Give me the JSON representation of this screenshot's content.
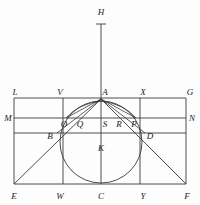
{
  "figure": {
    "type": "euclidean-construction",
    "canvas": {
      "width": 200,
      "height": 205
    },
    "stroke_color": "#3a3a3a",
    "label_color": "#1a1a1a",
    "background_color": "#fdfdfd"
  },
  "labels": {
    "H": "H",
    "L": "L",
    "V": "V",
    "A": "A",
    "X": "X",
    "G": "G",
    "M": "M",
    "N": "N",
    "O": "O",
    "Q": "Q",
    "S": "S",
    "R": "R",
    "P": "P",
    "B": "B",
    "D": "D",
    "K": "K",
    "E": "E",
    "W": "W",
    "C": "C",
    "Y": "Y",
    "F": "F"
  },
  "points": {
    "H": {
      "x": 101,
      "y": 12
    },
    "L": {
      "x": 15,
      "y": 92
    },
    "V": {
      "x": 60,
      "y": 92
    },
    "A": {
      "x": 105,
      "y": 92
    },
    "X": {
      "x": 143,
      "y": 92
    },
    "G": {
      "x": 190,
      "y": 92
    },
    "M": {
      "x": 8,
      "y": 118
    },
    "N": {
      "x": 192,
      "y": 118
    },
    "O": {
      "x": 64,
      "y": 124
    },
    "Q": {
      "x": 80,
      "y": 124
    },
    "S": {
      "x": 105,
      "y": 124
    },
    "R": {
      "x": 119,
      "y": 124
    },
    "P": {
      "x": 134,
      "y": 124
    },
    "B": {
      "x": 50,
      "y": 136
    },
    "D": {
      "x": 150,
      "y": 136
    },
    "K": {
      "x": 101,
      "y": 148
    },
    "E": {
      "x": 14,
      "y": 196
    },
    "W": {
      "x": 60,
      "y": 196
    },
    "C": {
      "x": 101,
      "y": 196
    },
    "Y": {
      "x": 143,
      "y": 196
    },
    "F": {
      "x": 187,
      "y": 196
    }
  },
  "geometry": {
    "rectangle": {
      "left": 14,
      "top": 98,
      "right": 186,
      "bottom": 184
    },
    "chord_mn_y": 118,
    "chord_bd_y": 133,
    "apex": {
      "x": 101,
      "y": 99
    },
    "circle": {
      "cx": 101,
      "cy": 142,
      "r": 41
    },
    "vertical_vw_x": 63,
    "vertical_xy_x": 140,
    "axis_top_y": 24,
    "tick_top_y": 24,
    "point_b": {
      "x": 57,
      "y": 133
    },
    "point_d": {
      "x": 145,
      "y": 133
    },
    "point_o": {
      "x": 68,
      "y": 118
    },
    "point_p": {
      "x": 134,
      "y": 118
    }
  }
}
